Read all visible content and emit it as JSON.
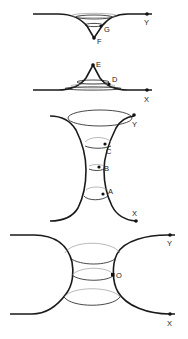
{
  "figures": [
    {
      "id": "fig1",
      "labels": {
        "end": "Y",
        "p1": "G",
        "p2": "F"
      }
    },
    {
      "id": "fig2",
      "labels": {
        "end": "X",
        "p1": "D",
        "p2": "E"
      }
    },
    {
      "id": "fig3",
      "labels": {
        "top": "Y",
        "bottom": "X",
        "c": "C",
        "b": "B",
        "a": "A"
      }
    },
    {
      "id": "fig4",
      "labels": {
        "top": "Y",
        "bottom": "X",
        "o": "O"
      }
    }
  ],
  "colors": {
    "line": "#1a1a1a",
    "faint": "#8a8a8a",
    "background": "#ffffff"
  }
}
